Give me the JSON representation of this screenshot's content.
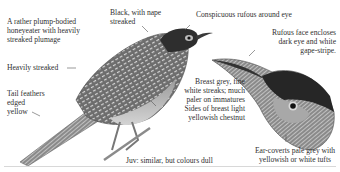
{
  "plate": {
    "subject": "Streaked honeyeater illustration (full bird and head detail)",
    "annotations": {
      "overview": "A rather plump-bodied\nhoneyeater with heavily\nstreaked plumage",
      "crown": "Black, with nape\nstreaked",
      "eye": "Conspicuous rufous around eye",
      "face": "Rufous face encloses\ndark eye and white\ngape-stripe.",
      "back": "Heavily streaked",
      "tail": "Tail feathers\nedged\nyellow",
      "breast": "Breast grey, fine\nwhite streaks; much\npaler on immatures",
      "breast_sides": "Sides of breast light\nyellowish chestnut",
      "juvenile": "Juv: similar, but colours dull",
      "ear_coverts": "Ear-coverts pale grey with\nyellowish or white tufts"
    },
    "colors": {
      "background": "#ffffff",
      "text": "#303030",
      "leader_line": "#555555",
      "plumage_dark": "#2b2b2b",
      "plumage_mid": "#7a7a7a",
      "plumage_light": "#c9c9c9"
    }
  }
}
